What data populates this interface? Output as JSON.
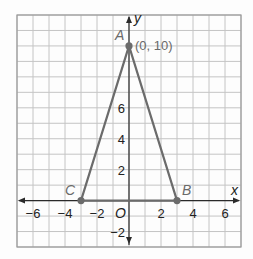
{
  "chart_data": {
    "type": "line",
    "title": "",
    "xlabel": "x",
    "ylabel": "y",
    "xlim": [
      -7,
      7
    ],
    "ylim": [
      -3,
      12
    ],
    "grid": true,
    "origin_label": "O",
    "x_ticks": [
      {
        "value": -6,
        "label": "−6"
      },
      {
        "value": -4,
        "label": "−4"
      },
      {
        "value": -2,
        "label": "−2"
      },
      {
        "value": 2,
        "label": "2"
      },
      {
        "value": 4,
        "label": "4"
      },
      {
        "value": 6,
        "label": "6"
      }
    ],
    "y_ticks": [
      {
        "value": 6,
        "label": "6"
      },
      {
        "value": 4,
        "label": "4"
      },
      {
        "value": 2,
        "label": "2"
      },
      {
        "value": -2,
        "label": "−2"
      }
    ],
    "series": [
      {
        "name": "Triangle ABC",
        "closed": true,
        "points": [
          {
            "name": "A",
            "x": 0,
            "y": 10,
            "annotation": "(0, 10)"
          },
          {
            "name": "B",
            "x": 3,
            "y": 0
          },
          {
            "name": "C",
            "x": -3,
            "y": 0
          }
        ]
      }
    ],
    "colors": {
      "grid": "#c4c4c4",
      "border": "#9a9a9a",
      "axis": "#2a2a2a",
      "shape": "#6b6b6b",
      "label": "#6a6a6a"
    }
  }
}
